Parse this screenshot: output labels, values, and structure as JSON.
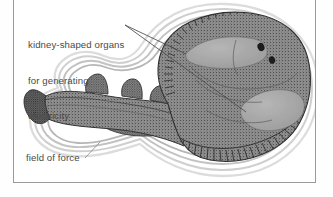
{
  "figure": {
    "kind": "scientific-illustration",
    "style": "grayscale stipple engraving",
    "frame": {
      "border_color": "#9a9a9a",
      "background": "#ffffff"
    }
  },
  "annotations": {
    "organs": {
      "name": "kidney-shaped-organs-label",
      "line1": "kidney-shaped organs",
      "line2": "for generating",
      "line3": "electricity",
      "full_text": "kidney-shaped organs for generating electricity",
      "leader_count": 2
    },
    "field": {
      "name": "field-of-force-label",
      "text": "field of force",
      "leader_count": 1
    }
  },
  "colors": {
    "text": "#4a4a4a",
    "leader_line": "#555555",
    "body_outline": "#3b3b3b",
    "body_fill": "#8d8d8d",
    "organ_fill": "#a9a9a9",
    "field_line": "#c9c9c9",
    "eye": "#1e1e1e",
    "frame": "#9a9a9a",
    "page": "#ffffff"
  },
  "anatomy": {
    "parts": [
      "disc (pectoral fin body)",
      "electric organ left",
      "electric organ right",
      "eye",
      "spiracle",
      "tail",
      "first dorsal fin",
      "second dorsal fin",
      "caudal fin",
      "pelvic fin",
      "fin margin hatching"
    ],
    "eye_count": 2,
    "dorsal_fin_count": 2,
    "field_of_force_ring_count": 4
  }
}
